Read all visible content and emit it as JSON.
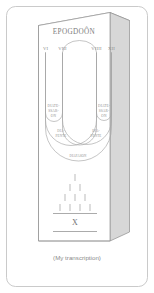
{
  "figure": {
    "title": "EPOGDOÔN",
    "caption": "(My transcription)",
    "numerals": [
      {
        "id": "vi",
        "label": "VI"
      },
      {
        "id": "viii",
        "label": "VIII"
      },
      {
        "id": "viiii",
        "label": "VIIII"
      },
      {
        "id": "xii",
        "label": "XII"
      }
    ],
    "interval_labels": {
      "diatessaron_left": {
        "line1": "DIATE-",
        "line2": "SSAR-",
        "line3": "ON"
      },
      "diatessaron_right": {
        "line1": "DIATE-",
        "line2": "SSAR-",
        "line3": "ON"
      },
      "diapente_left": {
        "line1": "DIA-",
        "line2": "PENTE"
      },
      "diapente_right": {
        "line1": "DIA-",
        "line2": "PENTE"
      },
      "diapason": "DIAPASON"
    },
    "tetractys": {
      "x_label": "X",
      "rows": [
        1,
        2,
        3,
        4
      ]
    },
    "colors": {
      "ink": "#9a9a9a",
      "ink_dark": "#6f6f6f",
      "slab_side": "#d7d7d7",
      "slab_top": "#ececec",
      "frame": "#bdbdbd",
      "page": "#ffffff"
    }
  }
}
